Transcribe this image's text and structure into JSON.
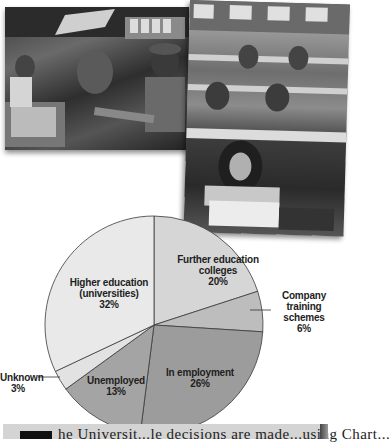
{
  "photos": [
    {
      "subject": "fast-food restaurant workers at counter"
    },
    {
      "subject": "students in lecture hall writing"
    }
  ],
  "chart_data": {
    "type": "pie",
    "title": "",
    "start_angle_deg": 0,
    "direction": "clockwise",
    "slices": [
      {
        "label": "Further education colleges",
        "label_lines": [
          "Further education",
          "colleges",
          "20%"
        ],
        "value": 20,
        "color": "#d6d6d6"
      },
      {
        "label": "Company training schemes",
        "label_lines": [
          "Company",
          "training",
          "schemes",
          "6%"
        ],
        "value": 6,
        "color": "#bdbdbd",
        "label_outside": true
      },
      {
        "label": "In employment",
        "label_lines": [
          "In employment",
          "26%"
        ],
        "value": 26,
        "color": "#9c9c9c"
      },
      {
        "label": "Unemployed",
        "label_lines": [
          "Unemployed",
          "13%"
        ],
        "value": 13,
        "color": "#a4a4a4"
      },
      {
        "label": "Unknown",
        "label_lines": [
          "Unknown",
          "3%"
        ],
        "value": 3,
        "color": "#e2e2e2",
        "label_outside": true
      },
      {
        "label": "Higher education (universities)",
        "label_lines": [
          "Higher education",
          "(universities)",
          "32%"
        ],
        "value": 32,
        "color": "#e9e9e9"
      }
    ],
    "values": [
      20,
      6,
      26,
      13,
      3,
      32
    ],
    "categories": [
      "Further education colleges",
      "Company training schemes",
      "In employment",
      "Unemployed",
      "Unknown",
      "Higher education (universities)"
    ],
    "legend": "none (labels on slices)"
  },
  "bottom_text": "he Universit...le decisions are made...using Chart..."
}
